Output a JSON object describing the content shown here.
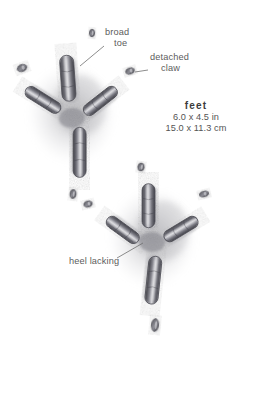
{
  "figure": {
    "medium": "pencil-drawing",
    "background_color": "#ffffff",
    "ink_color": "#5d5d62",
    "shadow_color": "#9a9a9f",
    "text_color": "#5c5c5c"
  },
  "labels": {
    "broad_toe": {
      "line1": "broad",
      "line2": "toe"
    },
    "detached_claw": {
      "line1": "detached",
      "line2": "claw"
    },
    "heel_lacking": {
      "text": "heel lacking"
    }
  },
  "measurements": {
    "title": "feet",
    "imperial": "6.0 x 4.5 in",
    "metric": "15.0 x 11.3 cm"
  },
  "tracks": [
    {
      "name": "upper-track",
      "center_x": 72,
      "center_y": 118,
      "rotation_deg": -6,
      "toes": [
        {
          "name": "broad-toe-top",
          "x": 72,
          "y": 78,
          "len": 46,
          "w": 14,
          "angle": 2
        },
        {
          "name": "toe-left",
          "x": 45,
          "y": 97,
          "len": 40,
          "w": 12,
          "angle": -52
        },
        {
          "name": "toe-right",
          "x": 102,
          "y": 104,
          "len": 40,
          "w": 12,
          "angle": 58
        },
        {
          "name": "hind-toe-bottom",
          "x": 76,
          "y": 153,
          "len": 50,
          "w": 13,
          "angle": 186
        }
      ]
    },
    {
      "name": "lower-track",
      "center_x": 152,
      "center_y": 242,
      "rotation_deg": 4,
      "toes": [
        {
          "name": "broad-toe-top",
          "x": 146,
          "y": 206,
          "len": 44,
          "w": 13,
          "angle": -4
        },
        {
          "name": "toe-left",
          "x": 122,
          "y": 232,
          "len": 38,
          "w": 12,
          "angle": -58
        },
        {
          "name": "toe-right",
          "x": 180,
          "y": 227,
          "len": 38,
          "w": 12,
          "angle": 55
        },
        {
          "name": "hind-toe-bottom",
          "x": 156,
          "y": 280,
          "len": 48,
          "w": 13,
          "angle": 182
        }
      ]
    }
  ],
  "detached_claw_marks": [
    {
      "name": "claw-top-left-outer",
      "x": 22,
      "y": 68,
      "rx": 5.0,
      "ry": 3.4,
      "angle": -20
    },
    {
      "name": "claw-above-track",
      "x": 92,
      "y": 33,
      "rx": 2.6,
      "ry": 3.8,
      "angle": 4
    },
    {
      "name": "claw-labeled",
      "x": 130,
      "y": 71,
      "rx": 4.4,
      "ry": 3.0,
      "angle": -18
    },
    {
      "name": "claw-mid-left",
      "x": 73,
      "y": 194,
      "rx": 3.0,
      "ry": 4.4,
      "angle": 6
    },
    {
      "name": "claw-mid-left-lower",
      "x": 88,
      "y": 204,
      "rx": 4.2,
      "ry": 3.0,
      "angle": -14
    },
    {
      "name": "claw-mid-right",
      "x": 204,
      "y": 194,
      "rx": 4.6,
      "ry": 2.8,
      "angle": -14
    },
    {
      "name": "claw-top-right",
      "x": 141,
      "y": 167,
      "rx": 3.2,
      "ry": 4.0,
      "angle": 8
    },
    {
      "name": "claw-below-track",
      "x": 155,
      "y": 325,
      "rx": 3.6,
      "ry": 6.4,
      "angle": 6
    }
  ],
  "leader_lines": [
    {
      "name": "leader-broad-toe",
      "x1": 104,
      "y1": 46,
      "x2": 80,
      "y2": 66
    },
    {
      "name": "leader-detached-claw",
      "x1": 148,
      "y1": 70,
      "x2": 135,
      "y2": 72
    },
    {
      "name": "leader-heel-lacking",
      "x1": 117,
      "y1": 258,
      "x2": 143,
      "y2": 243
    }
  ]
}
